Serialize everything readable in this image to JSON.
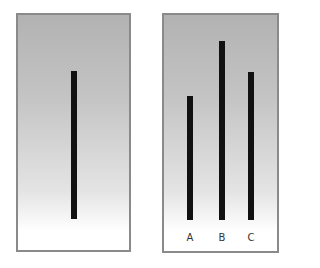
{
  "figure": {
    "colors": {
      "panel_border": "#8a8a8a",
      "bar": "#111111",
      "gradient_top": "#b2b2b2",
      "gradient_bottom": "#ffffff"
    }
  },
  "left_panel": {
    "reference_bar": {
      "x": 71,
      "top": 71,
      "bottom": 219,
      "width": 6
    }
  },
  "right_panel": {
    "bars": [
      {
        "label": "A",
        "x": 187,
        "top": 96,
        "bottom": 220,
        "width": 6
      },
      {
        "label": "B",
        "x": 219,
        "top": 41,
        "bottom": 220,
        "width": 6
      },
      {
        "label": "C",
        "x": 248,
        "top": 72,
        "bottom": 220,
        "width": 6
      }
    ]
  }
}
